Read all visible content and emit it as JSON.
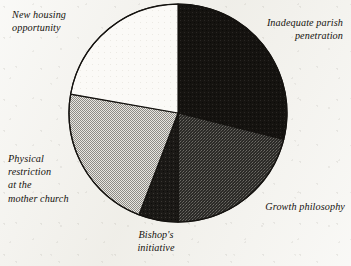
{
  "figure": {
    "background_color": "#f3f2ed",
    "outline_color": "#14120f",
    "width": 351,
    "height": 266
  },
  "chart_data": {
    "type": "pie",
    "title": "",
    "subtitle": "",
    "xlabel": "",
    "ylabel": "",
    "legend_position": "none",
    "grid": false,
    "units": "percent",
    "center": {
      "x": 178,
      "y": 113
    },
    "radius": 109,
    "start_angle_deg": 0,
    "direction": "clockwise",
    "labels": [
      "Inadequate parish\npenetration",
      "Growth philosophy",
      "Bishop's\ninitiative",
      "Physical\nrestriction\nat the\nmother church",
      "New housing\nopportunity"
    ],
    "categories": [
      "Inadequate parish penetration",
      "Growth philosophy",
      "Bishop's initiative",
      "Physical restriction at the mother church",
      "New housing opportunity"
    ],
    "values": [
      29,
      21,
      6,
      22,
      22
    ],
    "slices": [
      {
        "name": "Inadequate parish penetration",
        "label": "Inadequate parish\npenetration",
        "value": 29,
        "start_deg": 0,
        "end_deg": 104,
        "fill": "#151310",
        "pattern": "solid-black"
      },
      {
        "name": "Growth philosophy",
        "label": "Growth philosophy",
        "value": 21,
        "start_deg": 104,
        "end_deg": 180,
        "fill": "#3b3a36",
        "pattern": "dark-crosshatch"
      },
      {
        "name": "Bishop's initiative",
        "label": "Bishop's\ninitiative",
        "value": 6,
        "start_deg": 180,
        "end_deg": 201,
        "fill": "#1b1916",
        "pattern": "near-black"
      },
      {
        "name": "Physical restriction at the mother church",
        "label": "Physical\nrestriction\nat the\nmother church",
        "value": 22,
        "start_deg": 201,
        "end_deg": 280,
        "fill": "#b9b7b1",
        "pattern": "light-checkerboard"
      },
      {
        "name": "New housing opportunity",
        "label": "New housing\nopportunity",
        "value": 22,
        "start_deg": 280,
        "end_deg": 360,
        "fill": "#fbfaf7",
        "pattern": "white"
      }
    ]
  }
}
